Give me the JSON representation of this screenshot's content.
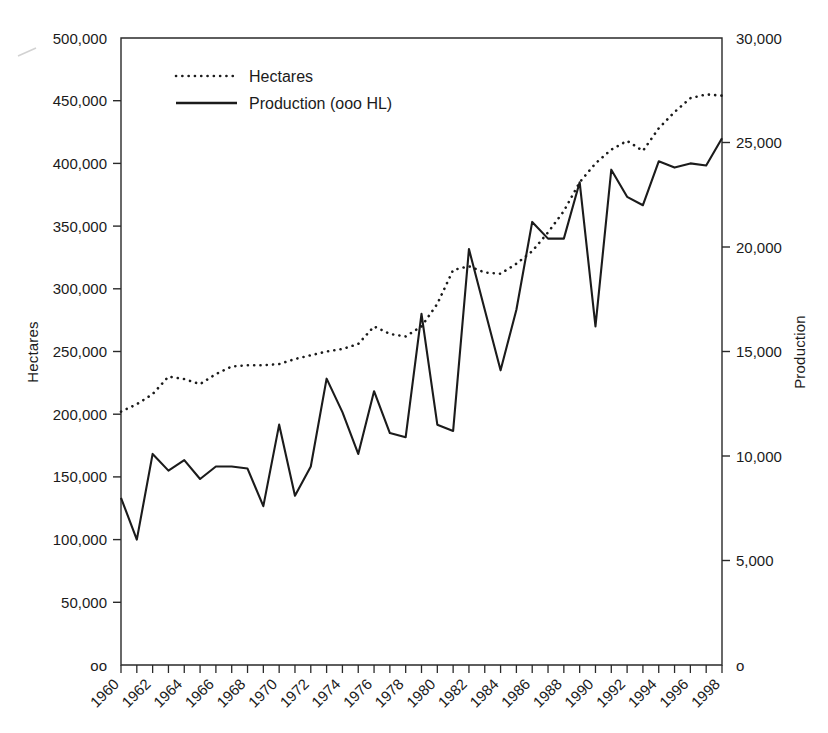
{
  "chart_data": {
    "type": "line",
    "title": "",
    "xlabel": "",
    "ylabel": "Hectares",
    "y2label": "Production",
    "grid": false,
    "legend_position": "top-left-inside",
    "x": [
      1960,
      1961,
      1962,
      1963,
      1964,
      1965,
      1966,
      1967,
      1968,
      1969,
      1970,
      1971,
      1972,
      1973,
      1974,
      1975,
      1976,
      1977,
      1978,
      1979,
      1980,
      1981,
      1982,
      1983,
      1984,
      1985,
      1986,
      1987,
      1988,
      1989,
      1990,
      1991,
      1992,
      1993,
      1994,
      1995,
      1996,
      1997,
      1998
    ],
    "xtick_labels": [
      "1960",
      "1962",
      "1964",
      "1966",
      "1968",
      "1970",
      "1972",
      "1974",
      "1976",
      "1978",
      "1980",
      "1982",
      "1984",
      "1986",
      "1988",
      "1990",
      "1992",
      "1994",
      "1996",
      "1998"
    ],
    "ylim": [
      0,
      500000
    ],
    "ytick_labels": [
      "oo",
      "50,000",
      "100,000",
      "150,000",
      "200,000",
      "250,000",
      "300,000",
      "350,000",
      "400,000",
      "450,000",
      "500,000"
    ],
    "ytick_values": [
      0,
      50000,
      100000,
      150000,
      200000,
      250000,
      300000,
      350000,
      400000,
      450000,
      500000
    ],
    "y2lim": [
      0,
      30000
    ],
    "y2tick_labels": [
      "o",
      "5,000",
      "10,000",
      "15,000",
      "20,000",
      "25,000",
      "30,000"
    ],
    "y2tick_values": [
      0,
      5000,
      10000,
      15000,
      20000,
      25000,
      30000
    ],
    "series": [
      {
        "name": "Hectares",
        "axis": "left",
        "style": "dotted",
        "color": "#1b1b1b",
        "values": [
          202000,
          208000,
          216000,
          230000,
          228000,
          224000,
          232000,
          238000,
          239000,
          239000,
          240000,
          244000,
          247000,
          250000,
          252000,
          256000,
          270000,
          264000,
          262000,
          270000,
          288000,
          315000,
          318000,
          313000,
          312000,
          320000,
          330000,
          345000,
          362000,
          385000,
          400000,
          411000,
          418000,
          410000,
          428000,
          441000,
          452000,
          455000,
          454000
        ]
      },
      {
        "name": "Production (ooo HL)",
        "axis": "right",
        "style": "solid",
        "color": "#1b1b1b",
        "values": [
          8000,
          6000,
          10100,
          9300,
          9800,
          8900,
          9500,
          9500,
          9400,
          7600,
          11500,
          8100,
          9500,
          13700,
          12100,
          10100,
          13100,
          11100,
          10900,
          16800,
          11500,
          11200,
          19900,
          17000,
          14100,
          17000,
          21200,
          20400,
          20400,
          23100,
          16200,
          23700,
          22400,
          22000,
          24100,
          23800,
          24000,
          23900,
          25200
        ]
      }
    ]
  },
  "legend": {
    "entries": [
      {
        "label": "Hectares",
        "style": "dotted"
      },
      {
        "label": "Production (ooo HL)",
        "style": "solid"
      }
    ]
  },
  "axes": {
    "left_title": "Hectares",
    "right_title": "Production"
  }
}
